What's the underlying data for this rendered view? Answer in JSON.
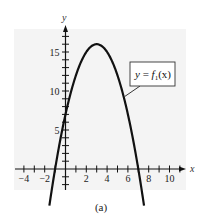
{
  "chart_data": {
    "type": "line",
    "title": "",
    "xlabel": "x",
    "ylabel": "y",
    "xlim": [
      -5,
      11
    ],
    "ylim": [
      -3,
      18
    ],
    "x_ticks": [
      -4,
      -2,
      2,
      4,
      6,
      8,
      10
    ],
    "y_ticks": [
      5,
      10,
      15
    ],
    "grid": false,
    "legend": "callout label near curve",
    "series": [
      {
        "name": "y = f1(x)",
        "function": "-x^2 + 6x + 7",
        "x": [
          -1.5,
          -1,
          0,
          1,
          2,
          3,
          4,
          5,
          6,
          7,
          7.5
        ],
        "y": [
          -4.25,
          0,
          7,
          12,
          15,
          16,
          15,
          12,
          7,
          0,
          -4.25
        ]
      }
    ],
    "annotations": [
      {
        "text": "y = f₁(x)",
        "points_to": [
          5.7,
          9.3
        ]
      }
    ]
  },
  "labels": {
    "x_axis": "x",
    "y_axis": "y",
    "x_tick_labels": [
      "−4",
      "−2",
      "2",
      "4",
      "6",
      "8",
      "10"
    ],
    "y_tick_labels": [
      "5",
      "10",
      "15"
    ],
    "callout_y": "y",
    "callout_eq": " = ",
    "callout_f": "f",
    "callout_sub": "1",
    "callout_arg": "(x)",
    "caption": "(a)"
  },
  "colors": {
    "panel": "#f4f4f4",
    "ink": "#111111"
  }
}
